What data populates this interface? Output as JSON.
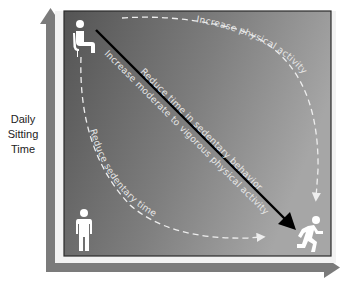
{
  "y_axis": {
    "label_lines": [
      "Daily",
      "Sitting",
      "Time"
    ]
  },
  "x_axis": {
    "label": ""
  },
  "paths": {
    "diagonal": "Reduce time in sedentary behavior",
    "diagonal_lower": "Increase moderate to vigorous physical activity",
    "top_right_curve": "Increase physical activity",
    "bottom_left_curve": "Reduce sedentary time"
  },
  "icons": {
    "top_left": "sitting-person-icon",
    "bottom_left": "standing-person-icon",
    "bottom_right": "running-person-icon"
  },
  "colors": {
    "axis_arrow": "#7b7b7b",
    "frame_light": "#f2f2f2",
    "panel_dark": "#555555",
    "panel_light": "#a3a3a3",
    "panel_border": "#2a2a2a",
    "main_arrow": "#000000",
    "dashed_lines": "#eeeeee",
    "icon_fill": "#ffffff"
  }
}
